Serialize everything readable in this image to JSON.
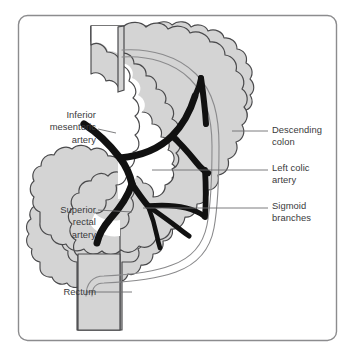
{
  "figure": {
    "frame_color": "#8c8c8e",
    "background_color": "#ffffff"
  },
  "anatomy": {
    "colon_fill_color": "#d4d4d4",
    "colon_outline_color": "#4a4a4c",
    "artery_color": "#111111",
    "marginal_artery_color": "#8a8a8c",
    "structures": [
      {
        "name": "descending-colon",
        "kind": "bowel"
      },
      {
        "name": "sigmoid-colon",
        "kind": "bowel"
      },
      {
        "name": "rectum",
        "kind": "bowel"
      },
      {
        "name": "inferior-mesenteric-artery",
        "kind": "artery"
      },
      {
        "name": "left-colic-artery",
        "kind": "artery"
      },
      {
        "name": "sigmoid-branches",
        "kind": "artery"
      },
      {
        "name": "superior-rectal-artery",
        "kind": "artery"
      },
      {
        "name": "marginal-artery",
        "kind": "artery"
      }
    ]
  },
  "labels": {
    "inferior_mesenteric_artery": "Inferior\nmesenteric\nartery",
    "superior_rectal_artery": "Superior\nrectal\nartery",
    "rectum": "Rectum",
    "descending_colon": "Descending\ncolon",
    "left_colic_artery": "Left colic\nartery",
    "sigmoid_branches": "Sigmoid\nbranches"
  },
  "leader_lines": {
    "color": "#6e6e70",
    "items": [
      {
        "name": "leader-inferior-mesenteric-artery",
        "x1": 98,
        "y1": 134,
        "x2": 118,
        "y2": 134
      },
      {
        "name": "leader-superior-rectal-artery",
        "x1": 98,
        "y1": 210,
        "x2": 132,
        "y2": 214
      },
      {
        "name": "leader-rectum",
        "x1": 85,
        "y1": 292,
        "x2": 130,
        "y2": 292
      },
      {
        "name": "leader-descending-colon",
        "x1": 232,
        "y1": 131,
        "x2": 268,
        "y2": 131
      },
      {
        "name": "leader-left-colic-artery",
        "x1": 152,
        "y1": 170,
        "x2": 268,
        "y2": 170
      },
      {
        "name": "leader-sigmoid-branches",
        "x1": 143,
        "y1": 208,
        "x2": 268,
        "y2": 208
      }
    ]
  }
}
